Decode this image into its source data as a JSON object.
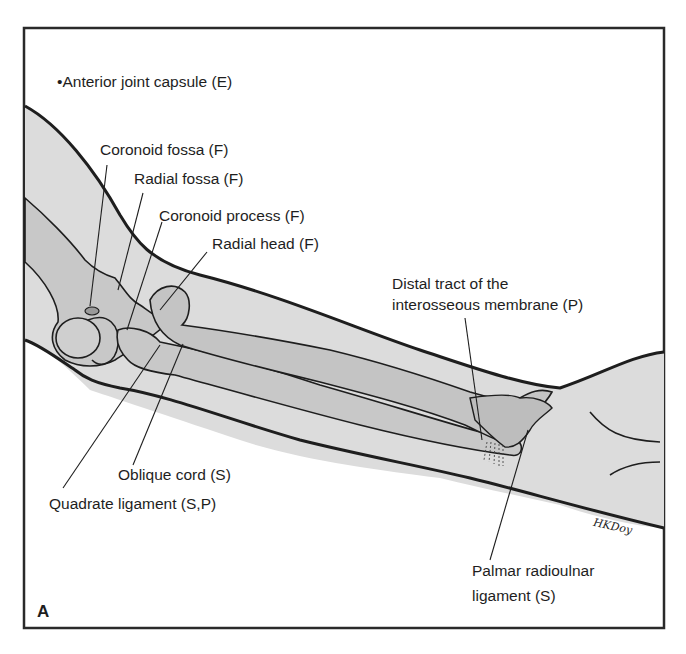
{
  "figure": {
    "panel_letter": "A",
    "signature": "HKDoy",
    "colors": {
      "frame": "#2a2a2a",
      "skin_fill": "#dcdcdc",
      "bone_fill": "#c8c8c8",
      "outline": "#1e1e1e",
      "background": "#ffffff"
    },
    "title_label": "•Anterior joint capsule (E)",
    "labels": [
      {
        "id": "coronoid-fossa",
        "text": "Coronoid fossa (F)"
      },
      {
        "id": "radial-fossa",
        "text": "Radial fossa (F)"
      },
      {
        "id": "coronoid-process",
        "text": "Coronoid process (F)"
      },
      {
        "id": "radial-head",
        "text": "Radial head (F)"
      },
      {
        "id": "distal-tract-line1",
        "text": "Distal tract of the"
      },
      {
        "id": "distal-tract-line2",
        "text": "interosseous membrane (P)"
      },
      {
        "id": "oblique-cord",
        "text": "Oblique cord (S)"
      },
      {
        "id": "quadrate-ligament",
        "text": "Quadrate ligament (S,P)"
      },
      {
        "id": "palmar-radioulnar-line1",
        "text": "Palmar radioulnar"
      },
      {
        "id": "palmar-radioulnar-line2",
        "text": "ligament (S)"
      }
    ]
  }
}
